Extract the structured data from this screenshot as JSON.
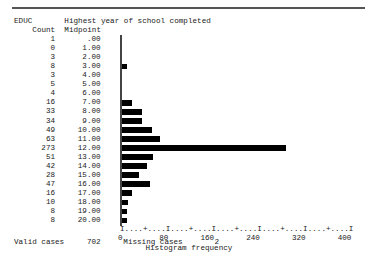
{
  "report": {
    "variable_name": "EDUC",
    "variable_label": "Highest year of school completed",
    "column_headers": {
      "count": "Count",
      "midpoint": "Midpoint"
    },
    "axis_caption": "Histogram frequency",
    "axis_tick_row": "I....+....I....+....I....+....I....+....I....+....I",
    "axis_number_row": "0        80       160       240       320       400",
    "footer": {
      "valid_label": "Valid cases",
      "valid_value": "702",
      "missing_label": "Missing cases",
      "missing_value": "2"
    }
  },
  "chart_data": {
    "type": "bar",
    "orientation": "horizontal",
    "title": "EDUC  Highest year of school completed",
    "xlabel": "Histogram frequency",
    "ylabel": "Midpoint",
    "xlim": [
      0,
      400
    ],
    "xticks": [
      0,
      80,
      160,
      240,
      320,
      400
    ],
    "grid": false,
    "legend": false,
    "categories": [
      "0.00",
      "1.00",
      "2.00",
      "3.00",
      "4.00",
      "5.00",
      "6.00",
      "7.00",
      "8.00",
      "9.00",
      "10.00",
      "11.00",
      "12.00",
      "13.00",
      "14.00",
      "15.00",
      "16.00",
      "17.00",
      "18.00",
      "19.00",
      "20.00"
    ],
    "values": [
      1,
      0,
      3,
      8,
      3,
      5,
      4,
      16,
      33,
      34,
      49,
      63,
      273,
      51,
      42,
      28,
      47,
      16,
      10,
      8,
      8
    ],
    "rows": [
      {
        "count": "1",
        "midpoint": ".00",
        "value": 1
      },
      {
        "count": "0",
        "midpoint": "1.00",
        "value": 0
      },
      {
        "count": "3",
        "midpoint": "2.00",
        "value": 3
      },
      {
        "count": "8",
        "midpoint": "3.00",
        "value": 8
      },
      {
        "count": "3",
        "midpoint": "4.00",
        "value": 3
      },
      {
        "count": "5",
        "midpoint": "5.00",
        "value": 5
      },
      {
        "count": "4",
        "midpoint": "6.00",
        "value": 4
      },
      {
        "count": "16",
        "midpoint": "7.00",
        "value": 16
      },
      {
        "count": "33",
        "midpoint": "8.00",
        "value": 33
      },
      {
        "count": "34",
        "midpoint": "9.00",
        "value": 34
      },
      {
        "count": "49",
        "midpoint": "10.00",
        "value": 49
      },
      {
        "count": "63",
        "midpoint": "11.00",
        "value": 63
      },
      {
        "count": "273",
        "midpoint": "12.00",
        "value": 273
      },
      {
        "count": "51",
        "midpoint": "13.00",
        "value": 51
      },
      {
        "count": "42",
        "midpoint": "14.00",
        "value": 42
      },
      {
        "count": "28",
        "midpoint": "15.00",
        "value": 28
      },
      {
        "count": "47",
        "midpoint": "16.00",
        "value": 47
      },
      {
        "count": "16",
        "midpoint": "17.00",
        "value": 16
      },
      {
        "count": "10",
        "midpoint": "18.00",
        "value": 10
      },
      {
        "count": "8",
        "midpoint": "19.00",
        "value": 8
      },
      {
        "count": "8",
        "midpoint": "20.00",
        "value": 8
      }
    ]
  }
}
